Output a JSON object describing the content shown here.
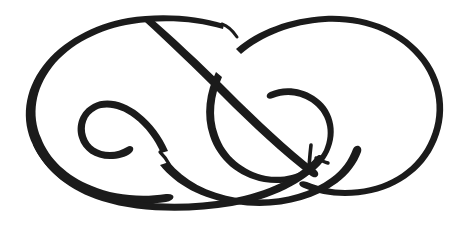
{
  "artwork": {
    "title": "Calligraphic Flourish Ornament",
    "type": "line-drawing",
    "description": "A single continuous pen-drawn ornamental flourish forming a horizontal figure-eight / infinity-like double loop with two inward spirals and a swelling thick-to-thin calligraphic stroke.",
    "medium": "ink on paper (scanned)",
    "canvas": {
      "width": 471,
      "height": 235,
      "background_color": "#ffffff"
    },
    "ink_color": "#1b1b1b",
    "stroke_weights": {
      "hairline": 2.6,
      "light": 3.4,
      "medium": 5.5,
      "heavy": 11.5
    },
    "composition": {
      "symmetry": "bilateral-ish, two opposing lobes",
      "left_lobe_extent": [
        25,
        16,
        240,
        200
      ],
      "right_lobe_extent": [
        215,
        16,
        447,
        196
      ],
      "crossing_points": [
        [
          222,
          78
        ],
        [
          236,
          104
        ],
        [
          318,
          158
        ],
        [
          168,
          150
        ]
      ]
    },
    "elements": [
      {
        "name": "left-outer-loop",
        "label": "Left outer loop",
        "note": "Large oval sweeping from top-centre leftwards, thin at the top and swelling heavy along the lower-left bow."
      },
      {
        "name": "right-outer-loop",
        "label": "Right outer loop",
        "note": "Large oval sweeping rightwards from top-centre, uniformly medium weight, closing into the heavy bottom stroke."
      },
      {
        "name": "left-inner-spiral",
        "label": "Left inner spiral",
        "note": "Inward curl terminating with a blunt tail inside the left lobe."
      },
      {
        "name": "right-inner-spiral",
        "label": "Right inner spiral",
        "note": "Inward curl inside the right lobe ending in a short vertical tick."
      },
      {
        "name": "diagonal-crossbar",
        "label": "Diagonal cross stroke",
        "note": "Long diagonal running from upper-left down to lower-right, crossing both lobes."
      },
      {
        "name": "bottom-heavy-sweep",
        "label": "Bottom heavy sweep",
        "note": "The thickest calligraphic swell forming the low bowl of the figure."
      },
      {
        "name": "terminal-tick",
        "label": "Terminal tick",
        "note": "Short vertical pen stroke marking the end of the right spiral."
      }
    ]
  }
}
